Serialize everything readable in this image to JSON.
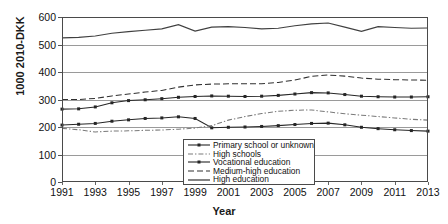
{
  "chart_data": {
    "type": "line",
    "title": "",
    "xlabel": "Year",
    "ylabel": "1000 2010-DKK",
    "xlim": [
      1991,
      2013
    ],
    "ylim": [
      0,
      600
    ],
    "ytick_labels": [
      "0",
      "100",
      "200",
      "300",
      "400",
      "500",
      "600"
    ],
    "ytick_values": [
      0,
      100,
      200,
      300,
      400,
      500,
      600
    ],
    "xtick_labels": [
      "1991",
      "1993",
      "1995",
      "1997",
      "1999",
      "2001",
      "2003",
      "2005",
      "2007",
      "2009",
      "2011",
      "2013"
    ],
    "xtick_values": [
      1991,
      1993,
      1995,
      1997,
      1999,
      2001,
      2003,
      2005,
      2007,
      2009,
      2011,
      2013
    ],
    "grid": "horizontal",
    "legend_position": "lower-center-right",
    "x": [
      1991,
      1992,
      1993,
      1994,
      1995,
      1996,
      1997,
      1998,
      1999,
      2000,
      2001,
      2002,
      2003,
      2004,
      2005,
      2006,
      2007,
      2008,
      2009,
      2010,
      2011,
      2012,
      2013
    ],
    "series": [
      {
        "name": "Primary school or unknown",
        "style": "solid-marker",
        "color": "#262626",
        "values": [
          207,
          210,
          213,
          221,
          226,
          231,
          233,
          237,
          231,
          197,
          199,
          200,
          202,
          205,
          209,
          213,
          214,
          208,
          199,
          194,
          190,
          187,
          185
        ]
      },
      {
        "name": "High schools",
        "style": "dash-dot",
        "color": "#7a7a7a",
        "values": [
          195,
          190,
          182,
          185,
          186,
          188,
          189,
          192,
          196,
          205,
          225,
          238,
          249,
          257,
          261,
          262,
          255,
          248,
          243,
          238,
          233,
          228,
          225
        ]
      },
      {
        "name": "Vocational education",
        "style": "solid-marker",
        "color": "#262626",
        "values": [
          265,
          266,
          273,
          288,
          296,
          299,
          303,
          308,
          311,
          313,
          312,
          311,
          312,
          315,
          320,
          325,
          324,
          318,
          312,
          310,
          309,
          309,
          310
        ]
      },
      {
        "name": "Medium-high education",
        "style": "dashed",
        "color": "#303030",
        "values": [
          300,
          300,
          304,
          313,
          320,
          327,
          333,
          345,
          353,
          356,
          357,
          357,
          357,
          362,
          371,
          384,
          389,
          385,
          378,
          374,
          372,
          371,
          370
        ]
      },
      {
        "name": "High education",
        "style": "solid",
        "color": "#404040",
        "values": [
          524,
          526,
          531,
          541,
          547,
          552,
          557,
          572,
          549,
          563,
          565,
          562,
          557,
          559,
          568,
          575,
          578,
          563,
          548,
          565,
          562,
          559,
          560
        ]
      }
    ]
  },
  "legend": {
    "items": [
      {
        "label": "Primary school or unknown"
      },
      {
        "label": "High schools"
      },
      {
        "label": "Vocational education"
      },
      {
        "label": "Medium-high education"
      },
      {
        "label": "High education"
      }
    ]
  }
}
